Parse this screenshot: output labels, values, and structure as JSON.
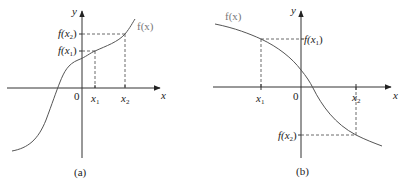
{
  "panels": [
    {
      "id": "a",
      "caption": "(a)",
      "function_label": "f(x)",
      "y_axis_label": "y",
      "x_axis_label": "x",
      "origin_label": "0",
      "x_ticks": [
        {
          "base": "x",
          "sub": "1"
        },
        {
          "base": "x",
          "sub": "2"
        }
      ],
      "y_ticks": [
        {
          "prefix": "f(x",
          "sub": "2",
          "suffix": ")"
        },
        {
          "prefix": "f(x",
          "sub": "1",
          "suffix": ")"
        }
      ],
      "behavior": "increasing"
    },
    {
      "id": "b",
      "caption": "(b)",
      "function_label": "f(x)",
      "y_axis_label": "y",
      "x_axis_label": "x",
      "origin_label": "0",
      "x_ticks": [
        {
          "base": "x",
          "sub": "1"
        },
        {
          "base": "x",
          "sub": "2"
        }
      ],
      "y_ticks": [
        {
          "prefix": "f(x",
          "sub": "1",
          "suffix": ")"
        },
        {
          "prefix": "f(x",
          "sub": "2",
          "suffix": ")"
        }
      ],
      "behavior": "decreasing"
    }
  ],
  "colors": {
    "stroke": "#333333",
    "curve": "#555555",
    "function_label": "#777777"
  }
}
